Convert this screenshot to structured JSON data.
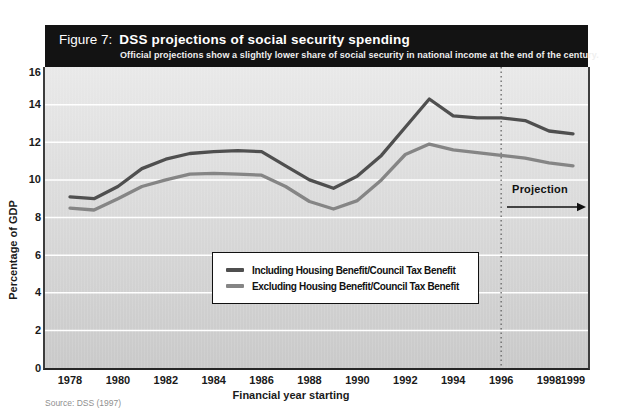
{
  "header": {
    "figure_label": "Figure 7:",
    "title": "DSS projections of social security spending",
    "subtitle": "Official projections show a slightly lower share of social security in national income at the end of the century."
  },
  "source": "Source: DSS (1997)",
  "chart_data": {
    "type": "line",
    "title": "DSS projections of social security spending",
    "xlabel": "Financial year starting",
    "ylabel": "Percentage of GDP",
    "x": [
      1978,
      1979,
      1980,
      1981,
      1982,
      1983,
      1984,
      1985,
      1986,
      1987,
      1988,
      1989,
      1990,
      1991,
      1992,
      1993,
      1994,
      1995,
      1996,
      1997,
      1998,
      1999
    ],
    "x_tick_years": [
      1978,
      1980,
      1982,
      1984,
      1986,
      1988,
      1990,
      1992,
      1994,
      1996,
      1998,
      1999
    ],
    "x_tick_labels": [
      "1978",
      "1980",
      "1982",
      "1984",
      "1986",
      "1988",
      "1990",
      "1992",
      "1994",
      "1996",
      "1998",
      "1999"
    ],
    "ylim": [
      0,
      16
    ],
    "y_ticks": [
      0,
      2,
      4,
      6,
      8,
      10,
      12,
      14,
      16
    ],
    "grid": "horizontal-white-gridlines",
    "legend_position": "boxed-center-lower",
    "series": [
      {
        "name": "Including Housing Benefit/Council Tax Benefit",
        "color": "#4f4f4f",
        "values": [
          9.1,
          9.0,
          9.65,
          10.6,
          11.1,
          11.4,
          11.5,
          11.55,
          11.5,
          10.75,
          10.0,
          9.55,
          10.2,
          11.3,
          12.8,
          14.3,
          13.4,
          13.3,
          13.3,
          13.15,
          12.6,
          12.45
        ]
      },
      {
        "name": "Excluding Housing Benefit/Council Tax Benefit",
        "color": "#858585",
        "values": [
          8.5,
          8.4,
          9.0,
          9.65,
          10.0,
          10.3,
          10.35,
          10.3,
          10.25,
          9.65,
          8.85,
          8.45,
          8.9,
          10.0,
          11.35,
          11.9,
          11.6,
          11.45,
          11.3,
          11.15,
          10.9,
          10.75
        ]
      }
    ],
    "annotations": {
      "projection_label": "Projection",
      "projection_start_year": 1996
    },
    "colors": {
      "title_bar": "#131313",
      "plot_bg_top": "#e9e9e9",
      "plot_bg_bottom": "#c9c9c9",
      "gridline": "#ffffff"
    }
  }
}
